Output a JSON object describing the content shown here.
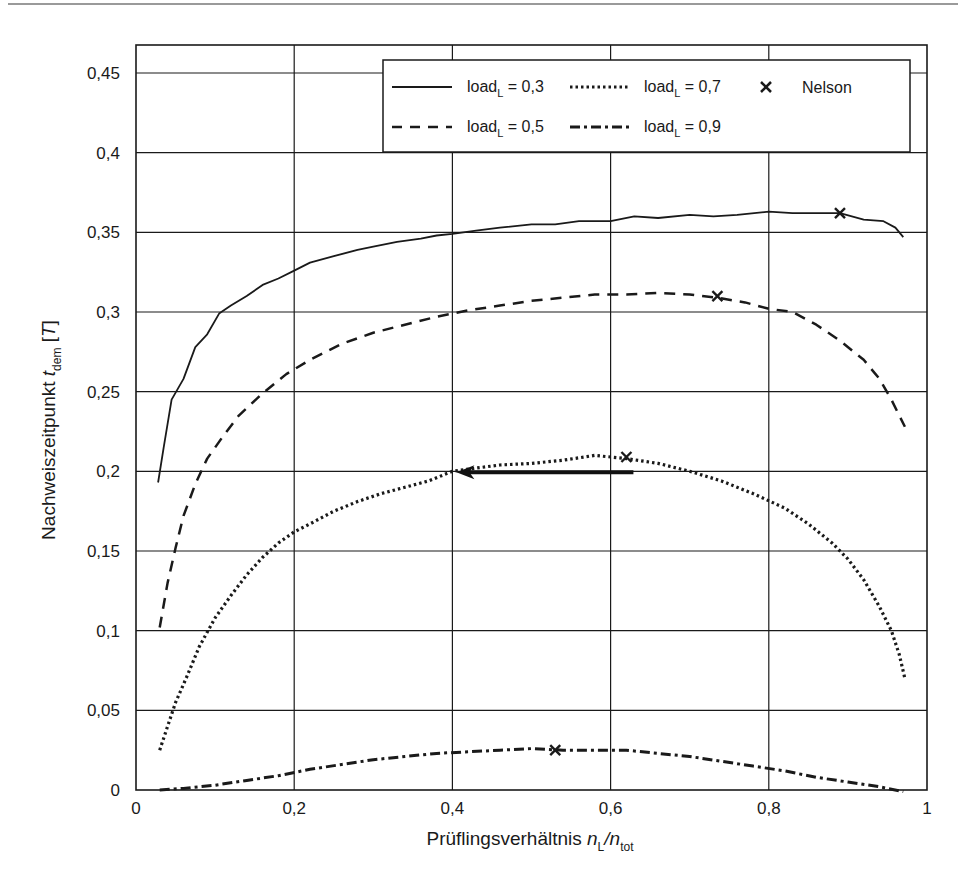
{
  "chart_data": {
    "type": "line",
    "title": "",
    "xlabel": "Prüflingsverhältnis n_L/n_tot",
    "xlabel_parts": {
      "main": "Prüflingsverhältnis ",
      "n1": "n",
      "sub1": "L",
      "slash": "/",
      "n2": "n",
      "sub2": "tot"
    },
    "ylabel": "Nachweiszeitpunkt t_dem [T]",
    "ylabel_parts": {
      "main": "Nachweiszeitpunkt ",
      "t": "t",
      "sub": "dem",
      "unit_open": " [",
      "unit": "T",
      "unit_close": "]"
    },
    "xlim": [
      0,
      1
    ],
    "ylim": [
      0,
      0.47
    ],
    "grid": true,
    "legend_position": "upper right",
    "x_ticks": [
      0,
      0.2,
      0.4,
      0.6,
      0.8,
      1
    ],
    "x_tick_labels": [
      "0",
      "0,2",
      "0,4",
      "0,6",
      "0,8",
      "1"
    ],
    "y_ticks": [
      0,
      0.05,
      0.1,
      0.15,
      0.2,
      0.25,
      0.3,
      0.35,
      0.4,
      0.45
    ],
    "y_tick_labels": [
      "0",
      "0,05",
      "0,1",
      "0,15",
      "0,2",
      "0,25",
      "0,3",
      "0,35",
      "0,4",
      "0,45"
    ],
    "series": [
      {
        "name": "load_L = 0,3",
        "legend_label": "load",
        "legend_sub": "L",
        "legend_value": " = 0,3",
        "style": "solid",
        "x": [
          0.028,
          0.035,
          0.045,
          0.06,
          0.075,
          0.09,
          0.105,
          0.12,
          0.14,
          0.16,
          0.18,
          0.2,
          0.22,
          0.25,
          0.28,
          0.3,
          0.33,
          0.36,
          0.38,
          0.4,
          0.43,
          0.46,
          0.5,
          0.53,
          0.56,
          0.6,
          0.63,
          0.66,
          0.7,
          0.73,
          0.76,
          0.8,
          0.83,
          0.86,
          0.89,
          0.92,
          0.945,
          0.96,
          0.97
        ],
        "y": [
          0.193,
          0.215,
          0.245,
          0.258,
          0.278,
          0.286,
          0.299,
          0.304,
          0.31,
          0.317,
          0.321,
          0.326,
          0.331,
          0.335,
          0.339,
          0.341,
          0.344,
          0.346,
          0.348,
          0.349,
          0.351,
          0.353,
          0.355,
          0.355,
          0.357,
          0.357,
          0.36,
          0.359,
          0.361,
          0.36,
          0.361,
          0.363,
          0.362,
          0.362,
          0.362,
          0.358,
          0.357,
          0.353,
          0.347
        ]
      },
      {
        "name": "load_L = 0,5",
        "legend_label": "load",
        "legend_sub": "L",
        "legend_value": " = 0,5",
        "style": "dashed",
        "x": [
          0.03,
          0.04,
          0.05,
          0.06,
          0.075,
          0.09,
          0.11,
          0.13,
          0.16,
          0.19,
          0.22,
          0.26,
          0.3,
          0.34,
          0.38,
          0.42,
          0.46,
          0.5,
          0.54,
          0.58,
          0.62,
          0.66,
          0.7,
          0.735,
          0.77,
          0.8,
          0.83,
          0.86,
          0.89,
          0.92,
          0.94,
          0.955,
          0.965,
          0.972
        ],
        "y": [
          0.102,
          0.13,
          0.152,
          0.172,
          0.192,
          0.208,
          0.222,
          0.235,
          0.249,
          0.261,
          0.27,
          0.28,
          0.287,
          0.292,
          0.297,
          0.301,
          0.304,
          0.307,
          0.309,
          0.311,
          0.311,
          0.312,
          0.311,
          0.309,
          0.306,
          0.302,
          0.3,
          0.292,
          0.282,
          0.27,
          0.258,
          0.245,
          0.235,
          0.228
        ]
      },
      {
        "name": "load_L = 0,7",
        "legend_label": "load",
        "legend_sub": "L",
        "legend_value": " = 0,7",
        "style": "dotted",
        "x": [
          0.03,
          0.04,
          0.05,
          0.065,
          0.08,
          0.1,
          0.12,
          0.14,
          0.16,
          0.18,
          0.2,
          0.22,
          0.25,
          0.28,
          0.31,
          0.34,
          0.37,
          0.4,
          0.43,
          0.46,
          0.5,
          0.54,
          0.58,
          0.62,
          0.66,
          0.7,
          0.74,
          0.78,
          0.82,
          0.85,
          0.88,
          0.9,
          0.92,
          0.94,
          0.955,
          0.965,
          0.972
        ],
        "y": [
          0.025,
          0.04,
          0.055,
          0.072,
          0.09,
          0.108,
          0.122,
          0.135,
          0.146,
          0.155,
          0.162,
          0.167,
          0.175,
          0.181,
          0.186,
          0.19,
          0.194,
          0.2,
          0.202,
          0.204,
          0.205,
          0.207,
          0.21,
          0.208,
          0.205,
          0.2,
          0.194,
          0.186,
          0.177,
          0.167,
          0.155,
          0.145,
          0.132,
          0.115,
          0.1,
          0.085,
          0.07
        ]
      },
      {
        "name": "load_L = 0,9",
        "legend_label": "load",
        "legend_sub": "L",
        "legend_value": " = 0,9",
        "style": "dashdot",
        "x": [
          0.03,
          0.06,
          0.1,
          0.14,
          0.18,
          0.22,
          0.26,
          0.3,
          0.34,
          0.38,
          0.42,
          0.46,
          0.5,
          0.54,
          0.58,
          0.62,
          0.66,
          0.7,
          0.74,
          0.78,
          0.82,
          0.86,
          0.9,
          0.94,
          0.97
        ],
        "y": [
          0.0,
          0.001,
          0.003,
          0.006,
          0.009,
          0.013,
          0.016,
          0.019,
          0.021,
          0.023,
          0.024,
          0.025,
          0.026,
          0.025,
          0.025,
          0.025,
          0.023,
          0.021,
          0.018,
          0.015,
          0.012,
          0.008,
          0.005,
          0.002,
          -0.001
        ]
      }
    ],
    "nelson_points": {
      "legend_label": "Nelson",
      "marker": "x",
      "x": [
        0.89,
        0.735,
        0.62,
        0.53
      ],
      "y": [
        0.362,
        0.31,
        0.209,
        0.025
      ]
    },
    "annotations": [
      {
        "type": "arrow",
        "from": [
          0.62,
          0.2
        ],
        "to": [
          0.4,
          0.2
        ],
        "description": "horizontal arrow pointing left"
      }
    ]
  }
}
